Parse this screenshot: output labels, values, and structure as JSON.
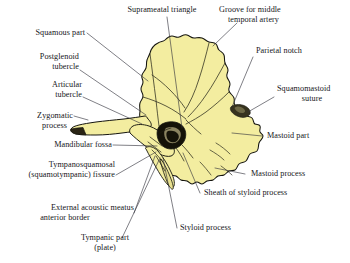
{
  "figure": {
    "kind": "anatomical-illustration",
    "fill_color": "#f3edA0",
    "outline_color": "#1a1a1a",
    "leader_color": "#2b2b33",
    "background": "#ffffff"
  },
  "labels": {
    "supra_meatal_triangle": "Suprameatal triangle",
    "groove_middle_temporal_artery_1": "Groove for middle",
    "groove_middle_temporal_artery_2": "temporal artery",
    "parietal_notch": "Parietal notch",
    "squamomastoid_suture_1": "Squamomastoid",
    "squamomastoid_suture_2": "suture",
    "mastoid_part": "Mastoid part",
    "mastoid_process": "Mastoid process",
    "sheath_of_styloid_process": "Sheath of styloid process",
    "styloid_process": "Styloid process",
    "squamous_part": "Squamous part",
    "postglenoid_tubercle_1": "Postglenoid",
    "postglenoid_tubercle_2": "tubercle",
    "articular_tubercle_1": "Articular",
    "articular_tubercle_2": "tubercle",
    "zygomatic_process_1": "Zygomatic",
    "zygomatic_process_2": "process",
    "mandibular_fossa": "Mandibular fossa",
    "tympanosquamosal_fissure_1": "Tympanosquamosal",
    "tympanosquamosal_fissure_2": "(squamotympanic) fissure",
    "external_acoustic_meatus_1": "External acoustic meatus",
    "external_acoustic_meatus_2": "anterior border",
    "tympanic_part_1": "Tympanic part",
    "tympanic_part_2": "(plate)"
  }
}
